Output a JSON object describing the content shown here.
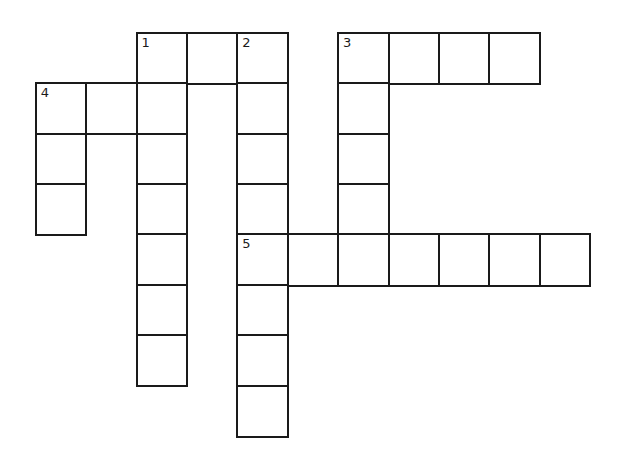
{
  "puzzle": {
    "type": "crossword",
    "grid_origin": {
      "x": 36,
      "y": 33
    },
    "cell_size": 50.4,
    "border_color": "#1a1a1a",
    "background": "#ffffff",
    "cells": [
      {
        "col": 2,
        "row": 0,
        "number": "1"
      },
      {
        "col": 3,
        "row": 0,
        "number": ""
      },
      {
        "col": 4,
        "row": 0,
        "number": "2"
      },
      {
        "col": 6,
        "row": 0,
        "number": "3"
      },
      {
        "col": 7,
        "row": 0,
        "number": ""
      },
      {
        "col": 8,
        "row": 0,
        "number": ""
      },
      {
        "col": 9,
        "row": 0,
        "number": ""
      },
      {
        "col": 0,
        "row": 1,
        "number": "4"
      },
      {
        "col": 1,
        "row": 1,
        "number": ""
      },
      {
        "col": 2,
        "row": 1,
        "number": ""
      },
      {
        "col": 4,
        "row": 1,
        "number": ""
      },
      {
        "col": 6,
        "row": 1,
        "number": ""
      },
      {
        "col": 0,
        "row": 2,
        "number": ""
      },
      {
        "col": 2,
        "row": 2,
        "number": ""
      },
      {
        "col": 4,
        "row": 2,
        "number": ""
      },
      {
        "col": 6,
        "row": 2,
        "number": ""
      },
      {
        "col": 0,
        "row": 3,
        "number": ""
      },
      {
        "col": 2,
        "row": 3,
        "number": ""
      },
      {
        "col": 4,
        "row": 3,
        "number": ""
      },
      {
        "col": 6,
        "row": 3,
        "number": ""
      },
      {
        "col": 2,
        "row": 4,
        "number": ""
      },
      {
        "col": 4,
        "row": 4,
        "number": "5"
      },
      {
        "col": 5,
        "row": 4,
        "number": ""
      },
      {
        "col": 6,
        "row": 4,
        "number": ""
      },
      {
        "col": 7,
        "row": 4,
        "number": ""
      },
      {
        "col": 8,
        "row": 4,
        "number": ""
      },
      {
        "col": 9,
        "row": 4,
        "number": ""
      },
      {
        "col": 10,
        "row": 4,
        "number": ""
      },
      {
        "col": 2,
        "row": 5,
        "number": ""
      },
      {
        "col": 4,
        "row": 5,
        "number": ""
      },
      {
        "col": 2,
        "row": 6,
        "number": ""
      },
      {
        "col": 4,
        "row": 6,
        "number": ""
      },
      {
        "col": 4,
        "row": 7,
        "number": ""
      }
    ],
    "entries": {
      "across": [
        {
          "number": "1",
          "length": 3
        },
        {
          "number": "3",
          "length": 4
        },
        {
          "number": "4",
          "length": 3
        },
        {
          "number": "5",
          "length": 7
        }
      ],
      "down": [
        {
          "number": "1",
          "length": 7
        },
        {
          "number": "2",
          "length": 8
        },
        {
          "number": "3",
          "length": 5
        },
        {
          "number": "4",
          "length": 3
        }
      ]
    }
  }
}
